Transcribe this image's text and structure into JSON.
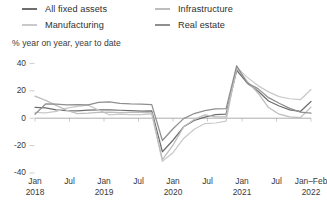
{
  "legend": {
    "columns": [
      {
        "items": [
          {
            "label": "All fixed assets",
            "color": "#6e6e6e",
            "key": "all-fixed-assets"
          },
          {
            "label": "Manufacturing",
            "color": "#c9c9c9",
            "key": "manufacturing"
          }
        ]
      },
      {
        "items": [
          {
            "label": "Infrastructure",
            "color": "#bdbdbd",
            "key": "infrastructure"
          },
          {
            "label": "Real estate",
            "color": "#8f8f8f",
            "key": "real-estate"
          }
        ]
      }
    ]
  },
  "axis": {
    "subtitle": "% year on year, year to date",
    "y_ticks": [
      "40",
      "20",
      "0",
      "-20",
      "-40"
    ],
    "x_ticks": [
      {
        "line1": "Jan",
        "line2": "2018"
      },
      {
        "line1": "Jul",
        "line2": ""
      },
      {
        "line1": "Jan",
        "line2": "2019"
      },
      {
        "line1": "Jul",
        "line2": ""
      },
      {
        "line1": "Jan",
        "line2": "2020"
      },
      {
        "line1": "Jul",
        "line2": ""
      },
      {
        "line1": "Jan",
        "line2": "2021"
      },
      {
        "line1": "Jul",
        "line2": ""
      },
      {
        "line1": "Jan–Feb",
        "line2": "2022"
      }
    ]
  },
  "chart_data": {
    "type": "line",
    "title": "",
    "subtitle": "% year on year, year to date",
    "xlabel": "",
    "ylabel": "% year on year, year to date",
    "ylim": [
      -45,
      42
    ],
    "yticks": [
      40,
      20,
      0,
      -20,
      -40
    ],
    "grid": false,
    "zero_line": true,
    "legend_position": "top",
    "x_category_labels": [
      "Jan 2018",
      "Jul 2018",
      "Jan 2019",
      "Jul 2019",
      "Jan 2020",
      "Jul 2020",
      "Jan 2021",
      "Jul 2021",
      "Jan–Feb 2022"
    ],
    "x": [
      "2018-02",
      "2018-03",
      "2018-05",
      "2018-07",
      "2018-09",
      "2018-11",
      "2019-02",
      "2019-04",
      "2019-06",
      "2019-08",
      "2019-10",
      "2019-12",
      "2020-02",
      "2020-03",
      "2020-05",
      "2020-07",
      "2020-09",
      "2020-11",
      "2020-12",
      "2021-02",
      "2021-03",
      "2021-04",
      "2021-06",
      "2021-08",
      "2021-10",
      "2021-12",
      "2022-02"
    ],
    "series": [
      {
        "name": "All fixed assets",
        "color": "#6e6e6e",
        "values": [
          7.9,
          7.5,
          6.1,
          5.5,
          5.4,
          5.9,
          6.1,
          6.1,
          5.8,
          5.5,
          5.2,
          5.4,
          -24.5,
          -16.1,
          -6.3,
          -1.6,
          0.8,
          2.6,
          2.9,
          35.0,
          25.6,
          19.9,
          12.6,
          8.9,
          6.1,
          4.9,
          12.2
        ]
      },
      {
        "name": "Manufacturing",
        "color": "#c9c9c9",
        "values": [
          4.3,
          3.8,
          5.0,
          7.3,
          8.7,
          9.5,
          5.9,
          2.5,
          3.0,
          2.6,
          2.6,
          3.1,
          -31.5,
          -25.2,
          -14.8,
          -8.1,
          -3.9,
          -3.5,
          -2.2,
          37.3,
          29.8,
          23.8,
          19.2,
          15.7,
          14.2,
          13.5,
          20.9
        ]
      },
      {
        "name": "Infrastructure",
        "color": "#bdbdbd",
        "values": [
          16.1,
          13.0,
          9.4,
          5.7,
          3.3,
          3.7,
          4.3,
          4.4,
          4.1,
          4.2,
          4.3,
          3.8,
          -30.3,
          -19.7,
          -6.3,
          -1.0,
          2.4,
          0.9,
          0.9,
          36.6,
          26.8,
          18.4,
          7.8,
          2.9,
          1.0,
          0.4,
          8.1
        ]
      },
      {
        "name": "Real estate",
        "color": "#8f8f8f",
        "values": [
          2.9,
          10.4,
          10.2,
          9.7,
          9.9,
          9.7,
          11.6,
          11.9,
          10.9,
          10.5,
          10.3,
          9.9,
          -16.3,
          -7.7,
          -0.3,
          3.4,
          5.6,
          6.8,
          7.0,
          38.3,
          25.6,
          21.6,
          15.0,
          10.9,
          7.2,
          4.4,
          3.7
        ]
      }
    ]
  },
  "colors": {
    "axis_line": "#8a8a8a",
    "tick_mark": "#b9b9b9",
    "text": "#3a3a3a",
    "background": "#ffffff"
  }
}
